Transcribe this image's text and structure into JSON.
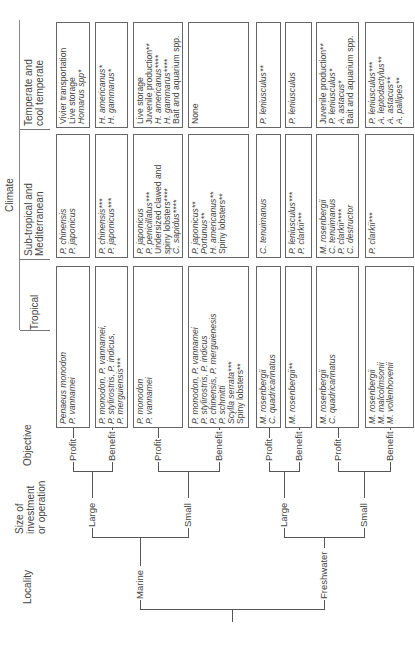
{
  "headers": {
    "locality": "Locality",
    "size": [
      "Size of",
      "investment",
      "or operation"
    ],
    "objective": "Objective",
    "climate": "Climate",
    "tropical": "Tropical",
    "subtropical": [
      "Sub-tropical and",
      "Mediterranean"
    ],
    "temperate": [
      "Temperate and",
      "cool temperate"
    ]
  },
  "tree": {
    "localities": [
      "Marine",
      "Freshwater"
    ],
    "sizes": [
      "Large",
      "Small",
      "Large",
      "Small"
    ],
    "objectives": [
      "Profit",
      "Benefit",
      "Profit",
      "Benefit",
      "Profit",
      "Benefit",
      "Profit",
      "Benefit"
    ]
  },
  "rows": [
    {
      "locality": "Marine",
      "size": "Large",
      "objective": "Profit",
      "tropical": [
        {
          "t": "Penaeus monodon",
          "i": true
        },
        {
          "t": "P. vannamei",
          "i": true
        }
      ],
      "subtropical": [
        {
          "t": "P. chinensis",
          "i": true
        },
        {
          "t": "P. japonicus",
          "i": true
        }
      ],
      "temperate": [
        {
          "t": "Vivier transportation",
          "i": false
        },
        {
          "t": "Live storage",
          "i": false
        },
        {
          "t": "Homarus spp*",
          "i": true
        }
      ]
    },
    {
      "locality": "Marine",
      "size": "Large",
      "objective": "Benefit",
      "tropical": [
        {
          "t": "P. monodon, P. vannamei,",
          "i": true
        },
        {
          "t": "P. stylirostris, P. indicus,",
          "i": true
        },
        {
          "t": "P. merguiensis***",
          "i": true
        }
      ],
      "subtropical": [
        {
          "t": "P. chinensis***",
          "i": true
        },
        {
          "t": "P. japonicus***",
          "i": true
        }
      ],
      "temperate": [
        {
          "t": "H. americanus*",
          "i": true
        },
        {
          "t": "H. gammarus*",
          "i": true
        }
      ]
    },
    {
      "locality": "Marine",
      "size": "Small",
      "objective": "Profit",
      "tropical": [
        {
          "t": "P. monodon",
          "i": true
        },
        {
          "t": "P. vannamei",
          "i": true
        }
      ],
      "subtropical": [
        {
          "t": "P. japonicus",
          "i": true
        },
        {
          "t": "P. penicillatus***",
          "i": true
        },
        {
          "t": "Undersized clawed and",
          "i": false
        },
        {
          "t": "spiny lobsters****",
          "i": false
        },
        {
          "t": "C. sapidus****",
          "i": true
        }
      ],
      "temperate": [
        {
          "t": "Live storage",
          "i": false
        },
        {
          "t": "Juvenile production**",
          "i": false
        },
        {
          "t": "H. americanus****",
          "i": true
        },
        {
          "t": "H. gammarus****",
          "i": true
        },
        {
          "t": "Bait and aquarium spp.",
          "i": false
        }
      ]
    },
    {
      "locality": "Marine",
      "size": "Small",
      "objective": "Benefit",
      "tropical": [
        {
          "t": "P. monodon, P. vannamei",
          "i": true
        },
        {
          "t": "P. stylirostris, P. indicus",
          "i": true
        },
        {
          "t": "P. chinensis, P. merguienesis",
          "i": true
        },
        {
          "t": "P. schmitti",
          "i": true
        },
        {
          "t": "Scylla serrata***",
          "i": true
        },
        {
          "t": "Spiny lobsters**",
          "i": false
        }
      ],
      "subtropical": [
        {
          "t": "P. japonicus**",
          "i": true
        },
        {
          "t": "Portunus**",
          "i": true
        },
        {
          "t": "H. americanus**",
          "i": true
        },
        {
          "t": "Spiny lobsters**",
          "i": false
        }
      ],
      "temperate": [
        {
          "t": "None",
          "i": false
        }
      ]
    },
    {
      "locality": "Freshwater",
      "size": "Large",
      "objective": "Profit",
      "tropical": [
        {
          "t": "M. rosenbergii",
          "i": true
        },
        {
          "t": "C. quadricarinatus",
          "i": true
        }
      ],
      "subtropical": [
        {
          "t": "C. tenuimanus",
          "i": true
        }
      ],
      "temperate": [
        {
          "t": "P. leniusculus**",
          "i": true
        }
      ]
    },
    {
      "locality": "Freshwater",
      "size": "Large",
      "objective": "Benefit",
      "tropical": [
        {
          "t": "M. rosenbergii**",
          "i": true
        }
      ],
      "subtropical": [
        {
          "t": "P. leniusculus***",
          "i": true
        },
        {
          "t": "P. clarkii***",
          "i": true
        }
      ],
      "temperate": [
        {
          "t": "P. leniusculus",
          "i": true
        }
      ]
    },
    {
      "locality": "Freshwater",
      "size": "Small",
      "objective": "Profit",
      "tropical": [
        {
          "t": "M. rosenbergii",
          "i": true
        },
        {
          "t": "C. quadricarinatus",
          "i": true
        }
      ],
      "subtropical": [
        {
          "t": "M. rosenbergii",
          "i": true
        },
        {
          "t": "C. tenuimanus",
          "i": true
        },
        {
          "t": "P. clarkii****",
          "i": true
        },
        {
          "t": "C. destructor",
          "i": true
        }
      ],
      "temperate": [
        {
          "t": "Juvenile production**",
          "i": false
        },
        {
          "t": "P. leniusculus*",
          "i": true
        },
        {
          "t": "A. astacus*",
          "i": true
        },
        {
          "t": "Bait and aquarium spp.",
          "i": false
        }
      ]
    },
    {
      "locality": "Freshwater",
      "size": "Small",
      "objective": "Benefit",
      "tropical": [
        {
          "t": "M. rosenbergii",
          "i": true
        },
        {
          "t": "M. malcolmsonii",
          "i": true
        },
        {
          "t": "M. vollenhovenii",
          "i": true
        }
      ],
      "subtropical": [
        {
          "t": "P. clarkii***",
          "i": true
        }
      ],
      "temperate": [
        {
          "t": "P. leniusculus***",
          "i": true
        },
        {
          "t": "A. leptodactylus**",
          "i": true
        },
        {
          "t": "A. astacus**",
          "i": true
        },
        {
          "t": "A. pallipes**",
          "i": true
        }
      ]
    }
  ]
}
